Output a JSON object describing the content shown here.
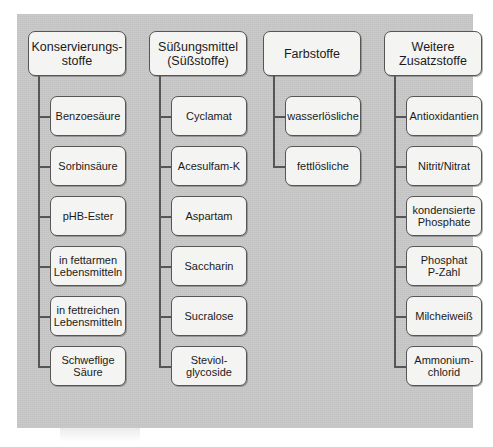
{
  "diagram": {
    "type": "hierarchy-tree",
    "title_visible": false,
    "background_color": "#c8c8c8",
    "node_fill_color": "#f4f4f2",
    "node_border_color": "#565656",
    "text_color": "#1b1b1b",
    "columns": [
      {
        "header": "Konservierungs-\nstoffe",
        "header_lines": [
          "Konservierungs-",
          "stoffe"
        ],
        "children": [
          {
            "label": "Benzoesäure",
            "lines": [
              "Benzoesäure"
            ]
          },
          {
            "label": "Sorbinsäure",
            "lines": [
              "Sorbinsäure"
            ]
          },
          {
            "label": "pHB-Ester",
            "lines": [
              "pHB-Ester"
            ]
          },
          {
            "label": "in fettarmen Lebensmitteln",
            "lines": [
              "in fettarmen",
              "Lebensmitteln"
            ]
          },
          {
            "label": "in fettreichen Lebensmitteln",
            "lines": [
              "in fettreichen",
              "Lebensmitteln"
            ]
          },
          {
            "label": "Schweflige Säure",
            "lines": [
              "Schweflige",
              "Säure"
            ]
          }
        ]
      },
      {
        "header": "Süßungsmittel\n(Süßstoffe)",
        "header_lines": [
          "Süßungsmittel",
          "(Süßstoffe)"
        ],
        "children": [
          {
            "label": "Cyclamat",
            "lines": [
              "Cyclamat"
            ]
          },
          {
            "label": "Acesulfam-K",
            "lines": [
              "Acesulfam-K"
            ]
          },
          {
            "label": "Aspartam",
            "lines": [
              "Aspartam"
            ]
          },
          {
            "label": "Saccharin",
            "lines": [
              "Saccharin"
            ]
          },
          {
            "label": "Sucralose",
            "lines": [
              "Sucralose"
            ]
          },
          {
            "label": "Steviolglycoside",
            "lines": [
              "Steviol-",
              "glycoside"
            ]
          }
        ]
      },
      {
        "header": "Farbstoffe",
        "header_lines": [
          "Farbstoffe"
        ],
        "children": [
          {
            "label": "wasserlösliche",
            "lines": [
              "wasserlösliche"
            ]
          },
          {
            "label": "fettlösliche",
            "lines": [
              "fettlösliche"
            ]
          }
        ]
      },
      {
        "header": "Weitere\nZusatzstoffe",
        "header_lines": [
          "Weitere",
          "Zusatzstoffe"
        ],
        "children": [
          {
            "label": "Antioxidantien",
            "lines": [
              "Antioxidantien"
            ]
          },
          {
            "label": "Nitrit/Nitrat",
            "lines": [
              "Nitrit/Nitrat"
            ]
          },
          {
            "label": "kondensierte Phosphate",
            "lines": [
              "kondensierte",
              "Phosphate"
            ]
          },
          {
            "label": "Phosphat P-Zahl",
            "lines": [
              "Phosphat",
              "P-Zahl"
            ]
          },
          {
            "label": "Milcheiweiß",
            "lines": [
              "Milcheiweiß"
            ]
          },
          {
            "label": "Ammoniumchlorid",
            "lines": [
              "Ammonium-",
              "chlorid"
            ]
          }
        ]
      }
    ]
  }
}
